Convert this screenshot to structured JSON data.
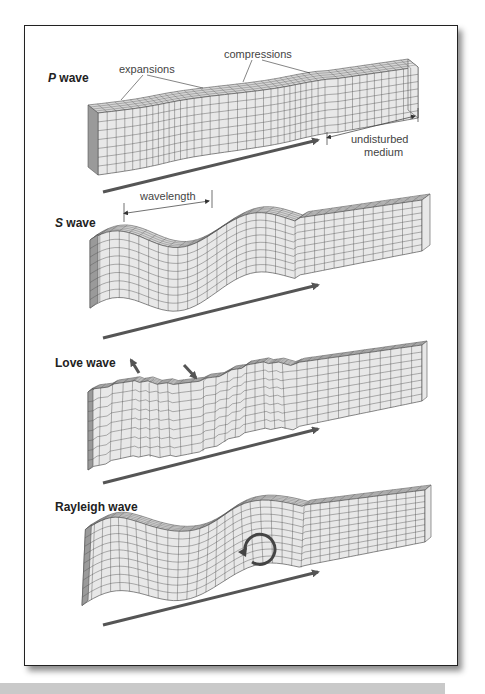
{
  "figure": {
    "panels": [
      {
        "id": "p-wave",
        "title_italic": "P",
        "title_rest": " wave",
        "annotations": {
          "expansions": "expansions",
          "compressions": "compressions",
          "undisturbed_1": "undisturbed",
          "undisturbed_2": "medium"
        }
      },
      {
        "id": "s-wave",
        "title_italic": "S",
        "title_rest": " wave",
        "annotations": {
          "wavelength": "wavelength"
        }
      },
      {
        "id": "love-wave",
        "title_italic": "",
        "title_rest": "Love wave",
        "annotations": {}
      },
      {
        "id": "rayleigh-wave",
        "title_italic": "",
        "title_rest": "Rayleigh wave",
        "annotations": {}
      }
    ],
    "colors": {
      "block_face": "#e8e8e8",
      "block_top": "#d4d4d4",
      "block_side": "#9a9a9a",
      "grid_line": "#555555",
      "arrow": "#555555"
    }
  }
}
